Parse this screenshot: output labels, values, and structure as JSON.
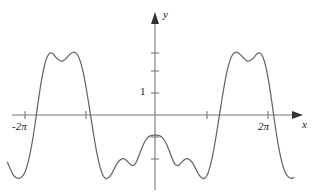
{
  "figure": {
    "kind": "math-function-graph",
    "background_color": "#ffffff",
    "stroke_color": "#666666",
    "axis_color": "#777777",
    "text_color": "#1a1a1a"
  },
  "axes": {
    "x_axis_label": "x",
    "y_axis_label": "y",
    "origin_px": {
      "x": 155,
      "y": 115
    },
    "unit_px": 22,
    "pi_px": 61,
    "x_axis_y_px": 115,
    "y_axis_x_px": 155,
    "x_arrow_end_px": 303,
    "y_arrow_end_px": 12,
    "x_tick_labels": [
      "-2π",
      "2π"
    ],
    "x_tick_values": [
      -6.2832,
      6.2832
    ],
    "x_tick_positions_px": [
      25,
      268
    ],
    "x_ticks_unlabeled_px": [
      86,
      207
    ],
    "y_tick_labels": [
      "1"
    ],
    "y_tick_values": [
      1
    ],
    "y_tick_positions_px": [
      93
    ],
    "y_ticks_unlabeled_px": [
      71,
      53,
      137,
      159
    ],
    "x_range": [
      -7.6,
      7.15
    ],
    "y_range": [
      -3.6,
      4.5
    ],
    "grid": false
  },
  "chart_data": {
    "type": "line",
    "title": "",
    "xlabel": "x",
    "ylabel": "y",
    "xlim": [
      -7.6,
      7.15
    ],
    "ylim": [
      -3.6,
      4.5
    ],
    "grid": false,
    "legend": false,
    "series": [
      {
        "name": "curve",
        "color": "#666666",
        "description": "periodic curve, period 2pi, M-shaped crests and W-shaped troughs",
        "x": [
          -7.6,
          -7.45,
          -7.3,
          -7.15,
          -7.0,
          -6.85,
          -6.7,
          -6.55,
          -6.4,
          -6.28,
          -6.15,
          -6.0,
          -5.85,
          -5.7,
          -5.55,
          -5.4,
          -5.25,
          -5.1,
          -4.95,
          -4.8,
          -4.71,
          -4.6,
          -4.45,
          -4.3,
          -4.15,
          -4.0,
          -3.85,
          -3.7,
          -3.55,
          -3.4,
          -3.25,
          -3.14,
          -3.0,
          -2.85,
          -2.7,
          -2.55,
          -2.4,
          -2.25,
          -2.1,
          -1.95,
          -1.8,
          -1.65,
          -1.57,
          -1.45,
          -1.3,
          -1.15,
          -1.0,
          -0.85,
          -0.7,
          -0.55,
          -0.4,
          -0.25,
          -0.1,
          0.0,
          0.1,
          0.25,
          0.4,
          0.55,
          0.7,
          0.85,
          1.0,
          1.15,
          1.3,
          1.45,
          1.57,
          1.65,
          1.8,
          1.95,
          2.1,
          2.25,
          2.4,
          2.55,
          2.7,
          2.85,
          3.0,
          3.14,
          3.25,
          3.4,
          3.55,
          3.7,
          3.85,
          4.0,
          4.15,
          4.3,
          4.45,
          4.6,
          4.71,
          4.8,
          4.95,
          5.1,
          5.25,
          5.4,
          5.55,
          5.7,
          5.85,
          6.0,
          6.15,
          6.28,
          6.4,
          6.55,
          6.7,
          6.85,
          7.0,
          7.15
        ],
        "y": [
          -2.15,
          -2.45,
          -2.72,
          -2.85,
          -2.88,
          -2.8,
          -2.6,
          -2.2,
          -1.6,
          -1.0,
          -0.25,
          0.7,
          1.55,
          2.22,
          2.65,
          2.82,
          2.78,
          2.62,
          2.5,
          2.45,
          2.48,
          2.55,
          2.7,
          2.82,
          2.85,
          2.75,
          2.45,
          1.95,
          1.25,
          0.45,
          -0.4,
          -1.0,
          -1.7,
          -2.3,
          -2.7,
          -2.88,
          -2.85,
          -2.7,
          -2.45,
          -2.2,
          -2.05,
          -1.98,
          -2.0,
          -2.08,
          -2.22,
          -2.3,
          -2.2,
          -1.9,
          -1.55,
          -1.25,
          -1.05,
          -0.95,
          -0.92,
          -0.92,
          -0.92,
          -0.95,
          -1.05,
          -1.25,
          -1.55,
          -1.9,
          -2.2,
          -2.3,
          -2.22,
          -2.08,
          -2.0,
          -1.98,
          -2.05,
          -2.2,
          -2.45,
          -2.7,
          -2.85,
          -2.88,
          -2.7,
          -2.3,
          -1.7,
          -1.0,
          -0.4,
          0.45,
          1.25,
          1.95,
          2.45,
          2.75,
          2.85,
          2.82,
          2.7,
          2.55,
          2.48,
          2.45,
          2.5,
          2.62,
          2.78,
          2.82,
          2.65,
          2.22,
          1.55,
          0.7,
          -0.25,
          -1.0,
          -1.6,
          -2.2,
          -2.6,
          -2.8,
          -2.88,
          -2.85
        ]
      }
    ]
  }
}
